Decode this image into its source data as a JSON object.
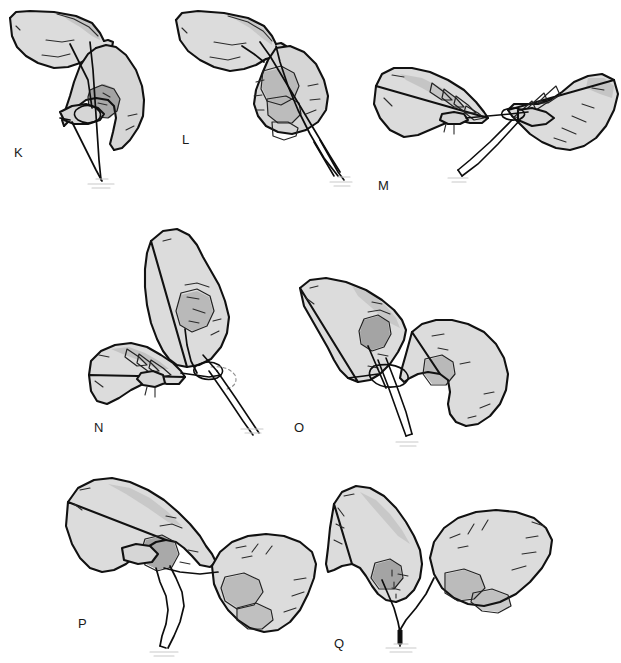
{
  "figure": {
    "background_color": "#ffffff",
    "width": 621,
    "height": 663,
    "label_color": "#1a1a1a",
    "glove_color": "#dcdcdc",
    "glove_shade_color": "#b3b3b3",
    "glove_shade_dark_color": "#9a9a9a",
    "outline_color": "#111111",
    "suture_color": "#0d0d0d",
    "panel_count": 7
  },
  "panels": [
    {
      "id": "K",
      "label": "K",
      "row": 1,
      "column": 1,
      "description": "Left hand held palm-down above a right hand whose thumb and index finger hold a suture loop; two suture strands descend vertically to the tissue below",
      "hands": 2,
      "suture_visible": true,
      "needle_visible": false,
      "label_x": 14,
      "label_y": 146
    },
    {
      "id": "L",
      "label": "L",
      "row": 1,
      "column": 2,
      "description": "Left hand palm-down over a closed right fist; suture strand runs diagonally down through the fingers to a needle tip at lower right",
      "hands": 2,
      "suture_visible": true,
      "needle_visible": true,
      "label_x": 182,
      "label_y": 133
    },
    {
      "id": "M",
      "label": "M",
      "row": 1,
      "column": 3,
      "description": "Two hands facing each other horizontally, suture strand stretched between the thumb-index pinch of each hand with a needle angled down-left",
      "hands": 2,
      "suture_visible": true,
      "needle_visible": true,
      "label_x": 378,
      "label_y": 179
    },
    {
      "id": "N",
      "row": 2,
      "column": 1,
      "label": "N",
      "description": "Upper-right hand held vertically pinching a suture; lower-left hand cupped palm-up; dashed ghost arc shows the loop being thrown over the needle holder",
      "hands": 2,
      "suture_visible": true,
      "needle_visible": true,
      "label_x": 94,
      "label_y": 421
    },
    {
      "id": "O",
      "label": "O",
      "row": 2,
      "column": 2,
      "description": "Left hand angled down-right pinching a suture loop around a needle holder; right hand open with thumb and index finger extended toward the loop",
      "hands": 2,
      "suture_visible": true,
      "needle_visible": true,
      "label_x": 294,
      "label_y": 421
    },
    {
      "id": "P",
      "label": "P",
      "row": 3,
      "column": 1,
      "description": "Left hand pinching a suture strand with thumb and index; right hand in a fist below-right holding the other strand; a long loop hangs down between them",
      "hands": 2,
      "suture_visible": true,
      "needle_visible": false,
      "label_x": 78,
      "label_y": 617
    },
    {
      "id": "Q",
      "label": "Q",
      "row": 3,
      "column": 2,
      "description": "Left hand pointing down with index finger tensioning one strand; right hand fisted holding the opposite strand; the knot is being seated at the tissue below",
      "hands": 2,
      "suture_visible": true,
      "needle_visible": false,
      "label_x": 334,
      "label_y": 637
    }
  ]
}
